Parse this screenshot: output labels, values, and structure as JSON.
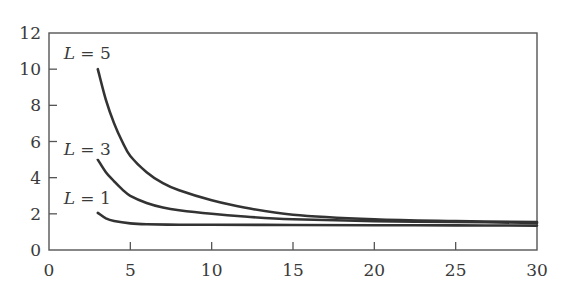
{
  "chart_data": {
    "type": "line",
    "title": "",
    "xlabel": "",
    "ylabel": "",
    "xlim": [
      0,
      30
    ],
    "ylim": [
      0,
      12
    ],
    "xticks": [
      0,
      5,
      10,
      15,
      20,
      25,
      30
    ],
    "yticks": [
      0,
      2,
      4,
      6,
      8,
      10,
      12
    ],
    "grid": false,
    "legend": "inline labels",
    "series": [
      {
        "name": "L = 5",
        "label_var": "L",
        "label_eq": " = 5",
        "label_at": [
          0.9,
          10.9
        ],
        "x": [
          3,
          3.5,
          4,
          4.5,
          5,
          6,
          7,
          8,
          10,
          12,
          15,
          20,
          25,
          30
        ],
        "y": [
          10,
          8.3,
          7.0,
          6.0,
          5.2,
          4.3,
          3.7,
          3.3,
          2.75,
          2.35,
          1.95,
          1.7,
          1.6,
          1.55
        ]
      },
      {
        "name": "L = 3",
        "label_var": "L",
        "label_eq": " = 3",
        "label_at": [
          0.9,
          5.6
        ],
        "x": [
          3,
          3.5,
          4,
          4.5,
          5,
          6,
          7,
          8,
          10,
          12,
          15,
          20,
          25,
          30
        ],
        "y": [
          5.0,
          4.3,
          3.8,
          3.35,
          3.0,
          2.6,
          2.35,
          2.2,
          2.0,
          1.85,
          1.7,
          1.6,
          1.55,
          1.5
        ]
      },
      {
        "name": "L = 1",
        "label_var": "L",
        "label_eq": " = 1",
        "label_at": [
          0.9,
          2.9
        ],
        "x": [
          3,
          3.5,
          4,
          5,
          6,
          8,
          10,
          15,
          20,
          25,
          30
        ],
        "y": [
          2.05,
          1.75,
          1.6,
          1.47,
          1.42,
          1.4,
          1.4,
          1.38,
          1.37,
          1.36,
          1.35
        ]
      }
    ]
  }
}
